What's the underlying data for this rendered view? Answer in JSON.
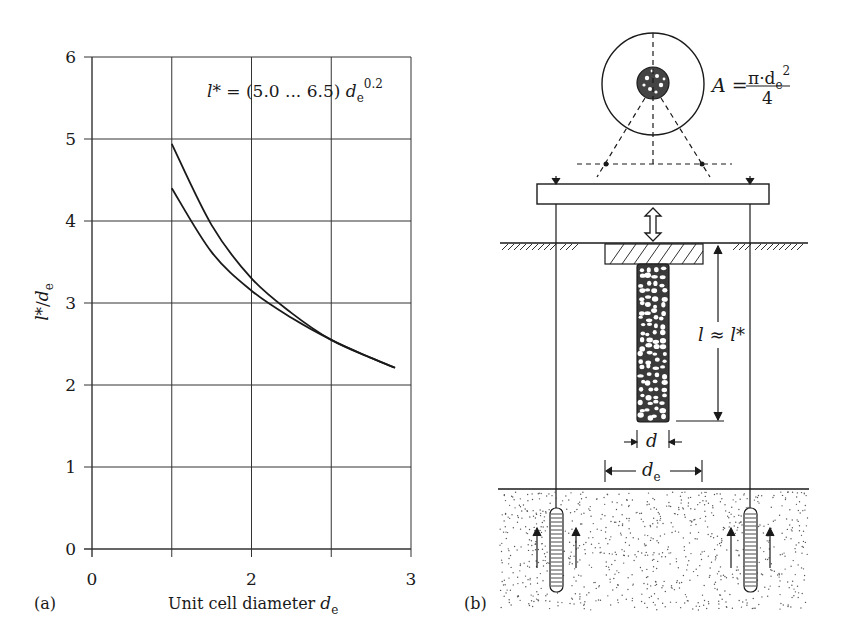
{
  "panel_a": {
    "label": "(a)",
    "formula": {
      "lhs": "l*",
      "eq": " = (5.0 ... 6.5) ",
      "var": "d",
      "sub": "e",
      "exp": "0.2"
    },
    "ylabel": {
      "var1": "l*",
      "slash": "/",
      "var2": "d",
      "sub": "e"
    },
    "xlabel": {
      "text": "Unit cell diameter ",
      "var": "d",
      "sub": "e"
    }
  },
  "panel_b": {
    "label": "(b)",
    "area_formula": {
      "lhs": "A",
      "eq": " = ",
      "num": "π·d",
      "num_sub": "e",
      "num_exp": "2",
      "den": "4"
    },
    "length_label": "l ≈ l*",
    "d_label": "d",
    "de_label": {
      "var": "d",
      "sub": "e"
    }
  },
  "chart_data": {
    "type": "line",
    "xlabel": "Unit cell diameter de",
    "ylabel": "l*/de",
    "x_tick_labels": [
      "0",
      "",
      "2",
      "",
      "3"
    ],
    "x_grid_positions": [
      0,
      1,
      2,
      3,
      4
    ],
    "y_ticks": [
      0,
      1,
      2,
      3,
      4,
      5,
      6
    ],
    "ylim": [
      0,
      6
    ],
    "grid": true,
    "series": [
      {
        "name": "upper (6.5)",
        "x": [
          1.0,
          1.5,
          2.0,
          2.5,
          3.0,
          3.5,
          3.8
        ],
        "y": [
          4.94,
          3.95,
          3.3,
          2.88,
          2.55,
          2.33,
          2.21
        ]
      },
      {
        "name": "lower (5.0)",
        "x": [
          1.0,
          1.5,
          2.0,
          2.5,
          3.0,
          3.5,
          3.8
        ],
        "y": [
          4.4,
          3.62,
          3.15,
          2.82,
          2.55,
          2.33,
          2.21
        ]
      }
    ]
  }
}
